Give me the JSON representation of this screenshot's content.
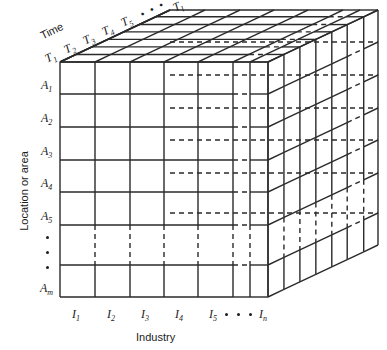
{
  "diagram": {
    "type": "three-dimensional-data-cube",
    "axes": {
      "x": {
        "title": "Industry",
        "symbol": "I",
        "ticks": [
          "I1",
          "I2",
          "I3",
          "I4",
          "I5",
          "In"
        ],
        "tick_labels": [
          "I",
          "I",
          "I",
          "I",
          "I",
          "I"
        ],
        "tick_subs": [
          "1",
          "2",
          "3",
          "4",
          "5",
          "n"
        ],
        "ellipsis": "• • •"
      },
      "y": {
        "title": "Location or area",
        "symbol": "A",
        "ticks": [
          "A1",
          "A2",
          "A3",
          "A4",
          "A5",
          "Am"
        ],
        "tick_labels": [
          "A",
          "A",
          "A",
          "A",
          "A",
          "A"
        ],
        "tick_subs": [
          "1",
          "2",
          "3",
          "4",
          "5",
          "m"
        ],
        "ellipsis": "• • •"
      },
      "z": {
        "title": "Time",
        "symbol": "T",
        "ticks": [
          "T1",
          "T2",
          "T3",
          "T4",
          "T5",
          "Tl"
        ],
        "tick_labels": [
          "T",
          "T",
          "T",
          "T",
          "T",
          "T"
        ],
        "tick_subs": [
          "1",
          "2",
          "3",
          "4",
          "5",
          "l"
        ],
        "ellipsis": "• • •"
      }
    },
    "geometry": {
      "front_left_x": 60,
      "front_right_x": 268,
      "front_top_y": 62,
      "front_bottom_y": 297,
      "depth_dx": 110,
      "depth_dy": -52,
      "col_edges": [
        60,
        95,
        130,
        164,
        198,
        233,
        250,
        268
      ],
      "row_edges": [
        62,
        94,
        127,
        160,
        192,
        225,
        265,
        297
      ],
      "depth_edges": [
        0,
        0.145,
        0.29,
        0.435,
        0.58,
        0.72,
        0.87,
        1.0
      ],
      "gap_col_index": 5,
      "gap_row_index": 5,
      "gap_depth_index": 5
    },
    "style": {
      "stroke": "#2a2a2a",
      "stroke_width": 1.4,
      "dash": "5,4",
      "background": "#ffffff"
    }
  }
}
